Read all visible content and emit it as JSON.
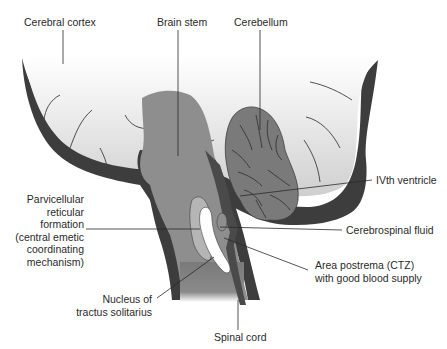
{
  "diagram": {
    "labels": {
      "cerebral_cortex": "Cerebral cortex",
      "brain_stem": "Brain stem",
      "cerebellum": "Cerebellum",
      "fourth_ventricle": "IVth ventricle",
      "parvicellular_1": "Parvicellular",
      "parvicellular_2": "reticular",
      "parvicellular_3": "formation",
      "parvicellular_4": "(central emetic",
      "parvicellular_5": "coordinating",
      "parvicellular_6": "mechanism)",
      "csf": "Cerebrospinal fluid",
      "area_postrema_1": "Area postrema (CTZ)",
      "area_postrema_2": "with good blood supply",
      "nts_1": "Nucleus of",
      "nts_2": "tractus solitarius",
      "spinal_cord": "Spinal cord"
    },
    "colors": {
      "outline_dark": "#3d3d3d",
      "cortex_light": "#d9d9d9",
      "brainstem": "#8e8e8e",
      "cerebellum": "#7a7a7a",
      "ventricle_dark": "#4a4a4a",
      "parvicellular": "#b5b5b5",
      "nts_white": "#ffffff"
    }
  }
}
